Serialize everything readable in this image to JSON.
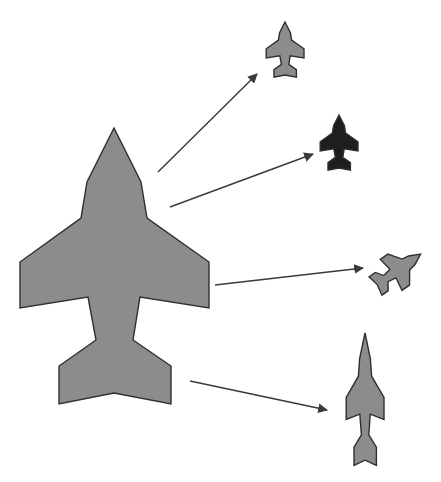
{
  "diagram": {
    "title": "",
    "colors": {
      "background": "#ffffff",
      "jet_fill": "#8c8c8c",
      "jet_dark_fill": "#1e1e1e",
      "outline": "#2f2f2f",
      "arrow": "#3a3a3a"
    },
    "source_shape": {
      "name": "original-jet",
      "fill": "#8c8c8c",
      "transform": "translate(0,0)"
    },
    "variants": [
      {
        "name": "scaled-jet",
        "label": "scaled",
        "fill": "#8c8c8c",
        "transform": "translate(285,22) scale(0.2) translate(-114,-128)"
      },
      {
        "name": "recolored-jet",
        "label": "recolored",
        "fill": "#1e1e1e",
        "transform": "translate(339,115) scale(0.2) translate(-114,-128)"
      },
      {
        "name": "rotated-jet",
        "label": "rotated",
        "fill": "#8c8c8c",
        "transform": "translate(398,270) rotate(55) scale(0.2) translate(-114,-266)"
      },
      {
        "name": "stretched-jet",
        "label": "stretched",
        "fill": "#8c8c8c",
        "transform": "translate(365,333) scale(0.2,0.48) translate(-114,-128)"
      }
    ],
    "arrows": [
      {
        "name": "arrow-to-scaled",
        "x1": 158,
        "y1": 172,
        "x2": 257,
        "y2": 74
      },
      {
        "name": "arrow-to-recolored",
        "x1": 170,
        "y1": 207,
        "x2": 313,
        "y2": 154
      },
      {
        "name": "arrow-to-rotated",
        "x1": 215,
        "y1": 285,
        "x2": 363,
        "y2": 268
      },
      {
        "name": "arrow-to-stretched",
        "x1": 190,
        "y1": 381,
        "x2": 327,
        "y2": 410
      }
    ]
  }
}
